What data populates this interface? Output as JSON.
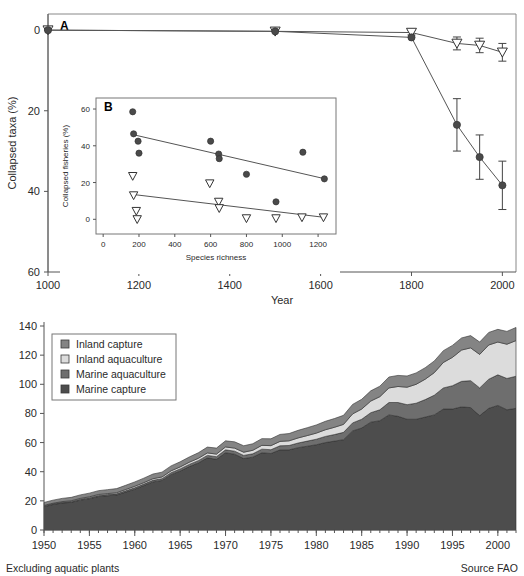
{
  "figure": {
    "panel_a_letter": "A",
    "panel_b_letter": "B"
  },
  "chart_data": [
    {
      "id": "panel-a",
      "type": "line",
      "title": "",
      "panel_letter": "A",
      "xlabel": "Year",
      "ylabel": "Collapsed taxa (%)",
      "xlim": [
        1000,
        2030
      ],
      "ylim": [
        60,
        -4
      ],
      "y_inverted": true,
      "xticks": [
        1000,
        1200,
        1400,
        1600,
        1800,
        2000
      ],
      "xticklabels": [
        "1000",
        "1200",
        "1400",
        "1600",
        "1800",
        "2000"
      ],
      "yticks": [
        0,
        20,
        40,
        60
      ],
      "yticklabels": [
        "0",
        "20",
        "40",
        "60"
      ],
      "grid": false,
      "legend": "none",
      "series": [
        {
          "name": "Species richness loss (open triangles)",
          "marker": "open-triangle-down",
          "x": [
            1000,
            1500,
            1800,
            1900,
            1950,
            2000
          ],
          "values": [
            0.0,
            0.3,
            0.6,
            3.3,
            3.8,
            5.5
          ],
          "yerr": [
            0.0,
            0.0,
            0.6,
            1.6,
            1.8,
            2.2
          ]
        },
        {
          "name": "Collapsed taxa (filled circles)",
          "marker": "filled-circle",
          "x": [
            1000,
            1500,
            1800,
            1900,
            1950,
            2000
          ],
          "values": [
            0.0,
            0.3,
            1.8,
            23.5,
            31.5,
            38.5
          ],
          "yerr": [
            0.0,
            0.0,
            0.0,
            6.5,
            5.5,
            6.0
          ]
        }
      ]
    },
    {
      "id": "panel-b-inset",
      "type": "scatter",
      "panel_letter": "B",
      "xlabel": "Species richness",
      "ylabel": "Collapsed fisheries (%)",
      "xlim": [
        -40,
        1300
      ],
      "ylim": [
        -8,
        66
      ],
      "xticks": [
        0,
        200,
        400,
        600,
        800,
        1000,
        1200
      ],
      "xticklabels": [
        "0",
        "200",
        "400",
        "600",
        "800",
        "1000",
        "1200"
      ],
      "yticks": [
        0,
        20,
        40,
        60
      ],
      "yticklabels": [
        "0",
        "20",
        "40",
        "60"
      ],
      "grid": false,
      "legend": "none",
      "series": [
        {
          "name": "Collapsed fisheries (filled circles)",
          "marker": "filled-circle",
          "x": [
            165,
            170,
            195,
            200,
            600,
            645,
            648,
            800,
            965,
            1115,
            1235
          ],
          "values": [
            58.5,
            46.5,
            42.5,
            36.0,
            42.5,
            35.5,
            33.0,
            24.5,
            9.5,
            36.5,
            22.0
          ]
        },
        {
          "name": "Collapsed fisheries (open triangles)",
          "marker": "open-triangle-down",
          "x": [
            165,
            170,
            185,
            190,
            595,
            645,
            648,
            800,
            965,
            1110,
            1230
          ],
          "values": [
            23.5,
            13.0,
            4.5,
            0.0,
            19.5,
            9.5,
            6.0,
            0.5,
            0.5,
            1.0,
            1.0
          ]
        }
      ],
      "trendlines": [
        {
          "name": "circle-fit",
          "x": [
            170,
            1240
          ],
          "y": [
            46.0,
            22.0
          ]
        },
        {
          "name": "triangle-fit",
          "x": [
            168,
            1240
          ],
          "y": [
            13.5,
            1.0
          ]
        }
      ]
    },
    {
      "id": "panel-c",
      "type": "area",
      "stacked": true,
      "title": "",
      "xlabel": "",
      "ylabel": "",
      "xlim": [
        1950,
        2002
      ],
      "ylim": [
        0,
        140
      ],
      "xticks": [
        1950,
        1955,
        1960,
        1965,
        1970,
        1975,
        1980,
        1985,
        1990,
        1995,
        2000
      ],
      "xticklabels": [
        "1950",
        "1955",
        "1960",
        "1965",
        "1970",
        "1975",
        "1980",
        "1985",
        "1990",
        "1995",
        "2000"
      ],
      "yticks": [
        0,
        20,
        40,
        60,
        80,
        100,
        120,
        140
      ],
      "yticklabels": [
        "0",
        "20",
        "40",
        "60",
        "80",
        "100",
        "120",
        "140"
      ],
      "grid": false,
      "legend_position": "upper-left",
      "x": [
        1950,
        1951,
        1952,
        1953,
        1954,
        1955,
        1956,
        1957,
        1958,
        1959,
        1960,
        1961,
        1962,
        1963,
        1964,
        1965,
        1966,
        1967,
        1968,
        1969,
        1970,
        1971,
        1972,
        1973,
        1974,
        1975,
        1976,
        1977,
        1978,
        1979,
        1980,
        1981,
        1982,
        1983,
        1984,
        1985,
        1986,
        1987,
        1988,
        1989,
        1990,
        1991,
        1992,
        1993,
        1994,
        1995,
        1996,
        1997,
        1998,
        1999,
        2000,
        2001,
        2002
      ],
      "series": [
        {
          "name": "Marine capture",
          "color": "#4d4d4d",
          "values": [
            16.0,
            17.5,
            18.5,
            19.0,
            20.5,
            21.5,
            23.0,
            23.5,
            24.0,
            26.0,
            28.0,
            30.5,
            33.0,
            34.0,
            38.0,
            40.5,
            43.5,
            46.0,
            49.5,
            48.5,
            53.0,
            52.0,
            49.0,
            50.0,
            53.0,
            52.5,
            55.0,
            55.0,
            56.5,
            57.5,
            58.5,
            60.0,
            61.0,
            62.0,
            68.0,
            70.0,
            74.0,
            75.0,
            79.0,
            78.0,
            76.0,
            76.0,
            77.5,
            79.0,
            83.0,
            83.0,
            84.5,
            84.0,
            78.5,
            83.5,
            85.5,
            82.5,
            83.5
          ]
        },
        {
          "name": "Marine aquaculture",
          "color": "#6e6e6e",
          "values": [
            0.5,
            0.5,
            0.5,
            0.6,
            0.6,
            0.7,
            0.7,
            0.8,
            0.8,
            0.9,
            1.0,
            1.0,
            1.1,
            1.2,
            1.3,
            1.4,
            1.5,
            1.6,
            1.7,
            1.8,
            2.0,
            2.1,
            2.2,
            2.3,
            2.5,
            2.6,
            2.8,
            3.0,
            3.2,
            3.5,
            3.8,
            4.2,
            4.5,
            5.0,
            5.5,
            6.0,
            6.5,
            7.5,
            8.5,
            9.5,
            10.0,
            11.0,
            12.0,
            13.5,
            14.5,
            16.0,
            17.5,
            18.5,
            19.0,
            20.0,
            21.0,
            21.5,
            22.0
          ]
        },
        {
          "name": "Inland aquaculture",
          "color": "#dcdcdc",
          "values": [
            0.4,
            0.4,
            0.5,
            0.5,
            0.6,
            0.6,
            0.7,
            0.7,
            0.8,
            0.9,
            1.0,
            1.0,
            1.1,
            1.2,
            1.3,
            1.4,
            1.5,
            1.6,
            1.7,
            1.8,
            2.0,
            2.1,
            2.2,
            2.4,
            2.6,
            2.8,
            3.0,
            3.2,
            3.5,
            3.8,
            4.2,
            4.6,
            5.0,
            5.5,
            6.2,
            7.0,
            8.0,
            9.0,
            10.0,
            11.0,
            12.0,
            13.0,
            14.0,
            15.5,
            17.5,
            19.5,
            21.5,
            22.5,
            23.0,
            23.5,
            22.5,
            23.5,
            24.5
          ]
        },
        {
          "name": "Inland capture",
          "color": "#848484",
          "values": [
            2.0,
            2.1,
            2.2,
            2.3,
            2.4,
            2.5,
            2.6,
            2.7,
            2.8,
            2.9,
            3.0,
            3.1,
            3.2,
            3.3,
            3.4,
            3.5,
            3.6,
            3.8,
            4.0,
            4.1,
            4.2,
            4.3,
            4.4,
            4.5,
            4.6,
            4.7,
            4.8,
            5.0,
            5.2,
            5.4,
            5.6,
            5.8,
            6.0,
            6.2,
            6.5,
            6.7,
            7.0,
            7.2,
            7.5,
            7.6,
            7.7,
            7.8,
            7.9,
            8.0,
            8.1,
            8.2,
            8.3,
            8.4,
            8.5,
            8.6,
            8.7,
            8.8,
            9.0
          ]
        }
      ],
      "legend_items": [
        {
          "label": "Inland capture",
          "color": "#848484"
        },
        {
          "label": "Inland aquaculture",
          "color": "#dcdcdc"
        },
        {
          "label": "Marine aquaculture",
          "color": "#6e6e6e"
        },
        {
          "label": "Marine capture",
          "color": "#4d4d4d"
        }
      ],
      "footnote_left": "Excluding aquatic plants",
      "footnote_right": "Source FAO"
    }
  ]
}
